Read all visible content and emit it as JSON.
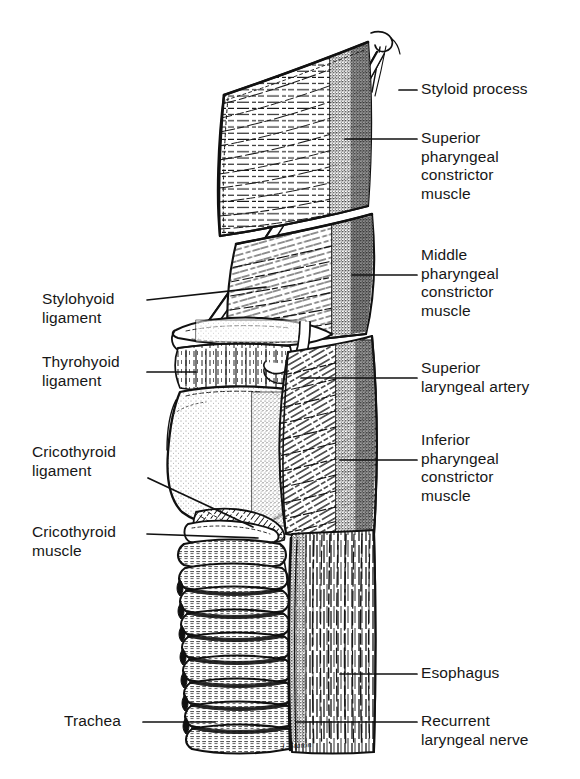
{
  "figure": {
    "signature": "J. Staton",
    "ink_color": "#111111",
    "background_color": "#ffffff",
    "leader_color": "#111111"
  },
  "labels_right": [
    {
      "name": "styloid-process",
      "text": "Styloid process"
    },
    {
      "name": "superior-constrictor",
      "text": "Superior\npharyngeal\nconstrictor\nmuscle"
    },
    {
      "name": "middle-constrictor",
      "text": "Middle\npharyngeal\nconstrictor\nmuscle"
    },
    {
      "name": "superior-laryngeal-artery",
      "text": "Superior\nlaryngeal artery"
    },
    {
      "name": "inferior-constrictor",
      "text": "Inferior\npharyngeal\nconstrictor\nmuscle"
    },
    {
      "name": "esophagus",
      "text": "Esophagus"
    },
    {
      "name": "recurrent-laryngeal-nerve",
      "text": "Recurrent\nlaryngeal nerve"
    }
  ],
  "labels_left": [
    {
      "name": "stylohyoid-ligament",
      "text": "Stylohyoid\nligament"
    },
    {
      "name": "thyrohyoid-ligament",
      "text": "Thyrohyoid\nligament"
    },
    {
      "name": "cricothyroid-ligament",
      "text": "Cricothyroid\nligament"
    },
    {
      "name": "cricothyroid-muscle",
      "text": "Cricothyroid\nmuscle"
    },
    {
      "name": "trachea",
      "text": "Trachea"
    }
  ]
}
